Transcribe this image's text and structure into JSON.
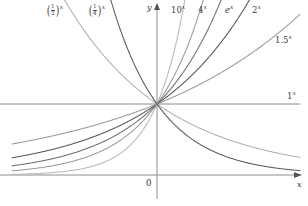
{
  "figure": {
    "background": "#ffffff"
  },
  "axes": {
    "x_axis_label": "x",
    "y_axis_label": "y",
    "origin_label": "0",
    "x_axis_y_px": 175,
    "y_axis_x_px": 157,
    "unit_px": 71,
    "x_range": [
      -2.05,
      2.05
    ],
    "y_range": [
      -0.1,
      2.45
    ],
    "axis_color": "#8c8c8c",
    "grid": false,
    "arrowheads": [
      "x-positive",
      "y-positive"
    ]
  },
  "chart_data": {
    "type": "line",
    "xlabel": "x",
    "ylabel": "y",
    "xlim": [
      -2.05,
      2.05
    ],
    "ylim": [
      -0.1,
      2.45
    ],
    "grid": false,
    "legend": "inline-curve-labels",
    "common_point": [
      0,
      1
    ],
    "x": [
      -2,
      -1.75,
      -1.5,
      -1.25,
      -1,
      -0.75,
      -0.5,
      -0.25,
      0,
      0.25,
      0.5,
      0.75,
      1,
      1.25,
      1.5,
      1.75,
      2
    ],
    "series": [
      {
        "name": "10^x",
        "label": "10",
        "exponent": "x",
        "base": 10,
        "color": "#b9b9b9",
        "kind": "growth",
        "values": [
          0.01,
          0.018,
          0.032,
          0.056,
          0.1,
          0.178,
          0.316,
          0.562,
          1,
          1.778,
          3.162,
          5.623,
          10,
          17.78,
          31.62,
          56.23,
          100
        ]
      },
      {
        "name": "4^x",
        "label": "4",
        "exponent": "x",
        "base": 4,
        "color": "#9a9a9a",
        "kind": "growth",
        "values": [
          0.0625,
          0.088,
          0.125,
          0.177,
          0.25,
          0.354,
          0.5,
          0.707,
          1,
          1.414,
          2,
          2.828,
          4,
          5.657,
          8,
          11.31,
          16
        ]
      },
      {
        "name": "e^x",
        "label": "e",
        "exponent": "x",
        "base": 2.71828,
        "color": "#6e6e6e",
        "kind": "growth",
        "values": [
          0.135,
          0.174,
          0.223,
          0.287,
          0.368,
          0.472,
          0.607,
          0.779,
          1,
          1.284,
          1.649,
          2.117,
          2.718,
          3.49,
          4.482,
          5.755,
          7.389
        ]
      },
      {
        "name": "2^x",
        "label": "2",
        "exponent": "x",
        "base": 2,
        "color": "#555555",
        "kind": "growth",
        "values": [
          0.25,
          0.297,
          0.354,
          0.42,
          0.5,
          0.595,
          0.707,
          0.841,
          1,
          1.189,
          1.414,
          1.682,
          2,
          2.378,
          2.828,
          3.364,
          4
        ]
      },
      {
        "name": "1.5^x",
        "label": "1.5",
        "exponent": "x",
        "base": 1.5,
        "color": "#9a9a9a",
        "kind": "growth",
        "values": [
          0.444,
          0.502,
          0.544,
          0.6,
          0.667,
          0.739,
          0.816,
          0.904,
          1,
          1.106,
          1.225,
          1.355,
          1.5,
          1.66,
          1.837,
          2.033,
          2.25
        ]
      },
      {
        "name": "1^x",
        "label": "1",
        "exponent": "x",
        "base": 1,
        "color": "#8c8c8c",
        "kind": "constant",
        "values": [
          1,
          1,
          1,
          1,
          1,
          1,
          1,
          1,
          1,
          1,
          1,
          1,
          1,
          1,
          1,
          1,
          1
        ]
      },
      {
        "name": "(1/2)^x",
        "label_numerator": "1",
        "label_denominator": "2",
        "exponent": "x",
        "base": 0.5,
        "color": "#b0b0b0",
        "kind": "decay",
        "values": [
          4,
          3.364,
          2.828,
          2.378,
          2,
          1.682,
          1.414,
          1.189,
          1,
          0.841,
          0.707,
          0.595,
          0.5,
          0.42,
          0.354,
          0.297,
          0.25
        ]
      },
      {
        "name": "(1/4)^x",
        "label_numerator": "1",
        "label_denominator": "4",
        "exponent": "x",
        "base": 0.25,
        "color": "#5a5a5a",
        "kind": "decay",
        "values": [
          16,
          11.31,
          8,
          5.657,
          4,
          2.828,
          2,
          1.414,
          1,
          0.707,
          0.5,
          0.354,
          0.25,
          0.177,
          0.125,
          0.088,
          0.0625
        ]
      }
    ]
  },
  "curve_labels": {
    "half": {
      "numerator": "1",
      "denominator": "2",
      "exponent": "x",
      "x_px": 46,
      "y_px": 4
    },
    "quarter": {
      "numerator": "1",
      "denominator": "4",
      "exponent": "x",
      "x_px": 88,
      "y_px": 4
    },
    "ten": {
      "text": "10",
      "exponent": "x",
      "x_px": 171,
      "y_px": 6
    },
    "four": {
      "text": "4",
      "exponent": "x",
      "x_px": 198,
      "y_px": 6
    },
    "e": {
      "text": "e",
      "exponent": "x",
      "x_px": 225,
      "y_px": 6
    },
    "two": {
      "text": "2",
      "exponent": "x",
      "x_px": 252,
      "y_px": 6
    },
    "onefive": {
      "text": "1.5",
      "exponent": "x",
      "x_px": 275,
      "y_px": 36
    },
    "one": {
      "text": "1",
      "exponent": "x",
      "x_px": 287,
      "y_px": 92
    }
  }
}
